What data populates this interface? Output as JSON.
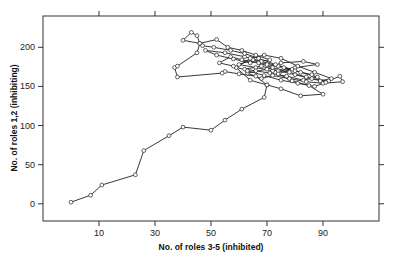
{
  "chart_data": {
    "type": "line",
    "title": "",
    "xlabel": "No. of roles 3-5 (inhibited)",
    "ylabel": "No. of roles 1,2 (inhibiting)",
    "xlim": [
      -10,
      110
    ],
    "ylim": [
      -22,
      240
    ],
    "xticks": [
      10,
      30,
      50,
      70,
      90
    ],
    "yticks": [
      0,
      50,
      100,
      150,
      200
    ],
    "grid": false,
    "legend": null,
    "marker": "open-circle",
    "series": [
      {
        "name": "trajectory",
        "points": [
          [
            0,
            2
          ],
          [
            7,
            11
          ],
          [
            11,
            24
          ],
          [
            23,
            37
          ],
          [
            26,
            68
          ],
          [
            35,
            87
          ],
          [
            40,
            98
          ],
          [
            50,
            94
          ],
          [
            55,
            107
          ],
          [
            61,
            121
          ],
          [
            69,
            136
          ],
          [
            70,
            152
          ],
          [
            66,
            163
          ],
          [
            60,
            166
          ],
          [
            55,
            169
          ],
          [
            54,
            167
          ],
          [
            38,
            162
          ],
          [
            37,
            174
          ],
          [
            38,
            176
          ],
          [
            45,
            193
          ],
          [
            46,
            205
          ],
          [
            40,
            209
          ],
          [
            43,
            219
          ],
          [
            45,
            215
          ],
          [
            46,
            205
          ],
          [
            52,
            210
          ],
          [
            56,
            200
          ],
          [
            61,
            196
          ],
          [
            66,
            190
          ],
          [
            71,
            184
          ],
          [
            64,
            180
          ],
          [
            58,
            185
          ],
          [
            52,
            190
          ],
          [
            48,
            196
          ],
          [
            55,
            193
          ],
          [
            62,
            188
          ],
          [
            68,
            182
          ],
          [
            74,
            176
          ],
          [
            79,
            172
          ],
          [
            72,
            170
          ],
          [
            66,
            174
          ],
          [
            60,
            178
          ],
          [
            65,
            184
          ],
          [
            70,
            178
          ],
          [
            76,
            174
          ],
          [
            82,
            168
          ],
          [
            88,
            162
          ],
          [
            83,
            158
          ],
          [
            77,
            163
          ],
          [
            71,
            167
          ],
          [
            66,
            170
          ],
          [
            62,
            172
          ],
          [
            68,
            176
          ],
          [
            74,
            170
          ],
          [
            80,
            165
          ],
          [
            86,
            160
          ],
          [
            92,
            157
          ],
          [
            96,
            163
          ],
          [
            97,
            156
          ],
          [
            90,
            154
          ],
          [
            84,
            156
          ],
          [
            78,
            160
          ],
          [
            72,
            164
          ],
          [
            68,
            160
          ],
          [
            63,
            167
          ],
          [
            70,
            172
          ],
          [
            75,
            180
          ],
          [
            83,
            182
          ],
          [
            88,
            178
          ],
          [
            80,
            174
          ],
          [
            74,
            166
          ],
          [
            79,
            157
          ],
          [
            85,
            151
          ],
          [
            90,
            140
          ],
          [
            82,
            138
          ],
          [
            75,
            147
          ],
          [
            70,
            152
          ],
          [
            64,
            158
          ],
          [
            59,
            174
          ],
          [
            64,
            186
          ],
          [
            69,
            190
          ],
          [
            75,
            186
          ],
          [
            81,
            176
          ],
          [
            87,
            168
          ],
          [
            93,
            160
          ],
          [
            89,
            157
          ],
          [
            84,
            162
          ],
          [
            78,
            168
          ],
          [
            72,
            174
          ],
          [
            67,
            180
          ],
          [
            61,
            184
          ],
          [
            57,
            188
          ],
          [
            53,
            180
          ],
          [
            58,
            176
          ],
          [
            63,
            170
          ],
          [
            69,
            164
          ],
          [
            75,
            158
          ],
          [
            81,
            154
          ],
          [
            87,
            150
          ],
          [
            91,
            155
          ],
          [
            86,
            165
          ],
          [
            80,
            170
          ],
          [
            73,
            178
          ],
          [
            67,
            186
          ],
          [
            62,
            192
          ],
          [
            57,
            196
          ],
          [
            51,
            200
          ],
          [
            47,
            202
          ]
        ]
      }
    ]
  }
}
